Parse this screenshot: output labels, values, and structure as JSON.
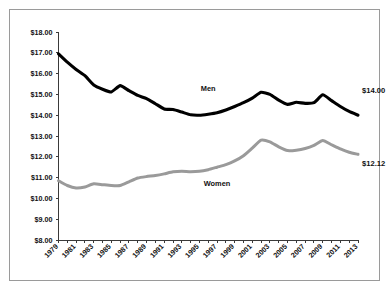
{
  "chart_data": {
    "type": "line",
    "title": "",
    "subtitle": "",
    "xlabel": "",
    "ylabel": "",
    "xlim": [
      1979,
      2013
    ],
    "ylim": [
      8.0,
      18.0
    ],
    "grid": false,
    "legend_position": "inline-annotation",
    "y_ticks": [
      8.0,
      9.0,
      10.0,
      11.0,
      12.0,
      13.0,
      14.0,
      15.0,
      16.0,
      17.0,
      18.0
    ],
    "y_tick_labels": [
      "$8.00",
      "$9.00",
      "$10.00",
      "$11.00",
      "$12.00",
      "$13.00",
      "$14.00",
      "$15.00",
      "$16.00",
      "$17.00",
      "$18.00"
    ],
    "x": [
      1979,
      1980,
      1981,
      1982,
      1983,
      1984,
      1985,
      1986,
      1987,
      1988,
      1989,
      1990,
      1991,
      1992,
      1993,
      1994,
      1995,
      1996,
      1997,
      1998,
      1999,
      2000,
      2001,
      2002,
      2003,
      2004,
      2005,
      2006,
      2007,
      2008,
      2009,
      2010,
      2011,
      2012,
      2013
    ],
    "x_tick_labels": [
      "1979",
      "1981",
      "1983",
      "1985",
      "1987",
      "1989",
      "1991",
      "1993",
      "1995",
      "1997",
      "1999",
      "2001",
      "2003",
      "2005",
      "2007",
      "2009",
      "2011",
      "2013"
    ],
    "x_tick_years": [
      1979,
      1981,
      1983,
      1985,
      1987,
      1989,
      1991,
      1993,
      1995,
      1997,
      1999,
      2001,
      2003,
      2005,
      2007,
      2009,
      2011,
      2013
    ],
    "series": [
      {
        "name": "Men",
        "color": "#000000",
        "label_text": "Men",
        "label_year": 1996,
        "label_value": 15.18,
        "endpoint_label": "$14.00",
        "values": [
          16.95,
          16.55,
          16.2,
          15.9,
          15.45,
          15.25,
          15.12,
          15.42,
          15.18,
          14.95,
          14.8,
          14.55,
          14.3,
          14.27,
          14.15,
          14.02,
          14.0,
          14.05,
          14.12,
          14.25,
          14.42,
          14.6,
          14.82,
          15.1,
          15.0,
          14.72,
          14.52,
          14.62,
          14.57,
          14.6,
          14.98,
          14.7,
          14.42,
          14.18,
          14.0
        ]
      },
      {
        "name": "Women",
        "color": "#9a9a9a",
        "label_text": "Women",
        "label_year": 1997,
        "label_value": 10.62,
        "endpoint_label": "$12.12",
        "values": [
          10.85,
          10.62,
          10.5,
          10.55,
          10.7,
          10.66,
          10.62,
          10.62,
          10.8,
          10.98,
          11.05,
          11.1,
          11.18,
          11.28,
          11.3,
          11.28,
          11.3,
          11.38,
          11.5,
          11.62,
          11.8,
          12.05,
          12.42,
          12.8,
          12.72,
          12.48,
          12.3,
          12.32,
          12.4,
          12.55,
          12.78,
          12.58,
          12.38,
          12.22,
          12.12
        ]
      }
    ],
    "annotations": [
      {
        "name": "men-endpoint",
        "text": "$14.00",
        "year": 2013,
        "value": 15.05
      },
      {
        "name": "women-endpoint",
        "text": "$12.12",
        "year": 2013,
        "value": 11.55
      }
    ],
    "colors": {
      "men_line": "#000000",
      "women_line": "#9a9a9a",
      "axis": "#3a3a3a",
      "frame_border": "#9a9a9a",
      "background": "#ffffff",
      "text": "#111111"
    }
  }
}
